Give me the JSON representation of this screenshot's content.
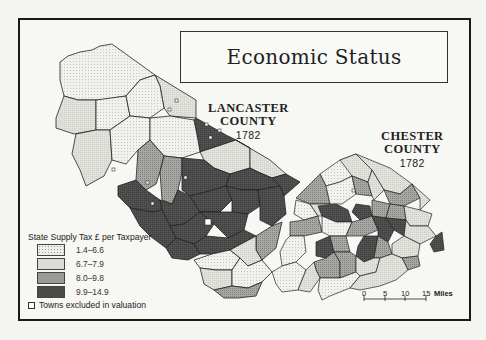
{
  "title": "Economic Status",
  "counties": [
    {
      "name": "LANCASTER COUNTY",
      "line1": "LANCASTER",
      "line2": "COUNTY",
      "year": "1782"
    },
    {
      "name": "CHESTER COUNTY",
      "line1": "CHESTER",
      "line2": "COUNTY",
      "year": "1782"
    }
  ],
  "legend": {
    "title": "State Supply Tax £ per Taxpayer",
    "classes": [
      {
        "range": "1.4–6.6",
        "fill": "#eeeeea",
        "pattern": "dotted"
      },
      {
        "range": "6.7–7.9",
        "fill": "#dcdcd6",
        "pattern": "fine-stipple"
      },
      {
        "range": "8.0–9.8",
        "fill": "#9a9a96",
        "pattern": "medium-stipple"
      },
      {
        "range": "9.9–14.9",
        "fill": "#4a4a48",
        "pattern": "dark"
      }
    ],
    "note": "Towns excluded in valuation",
    "note_icon": "square-marker-icon"
  },
  "scale": {
    "ticks": [
      "0",
      "5",
      "10",
      "15"
    ],
    "unit": "Miles"
  },
  "colors": {
    "frame": "#1a1a1a",
    "background": "#f7f7f4",
    "boundary": "#222222"
  }
}
